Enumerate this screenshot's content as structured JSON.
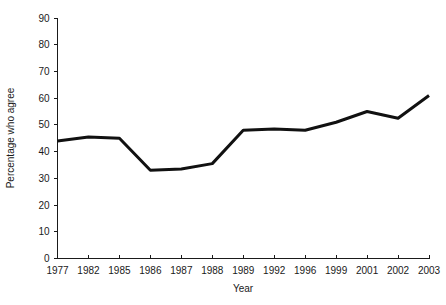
{
  "chart_data": {
    "type": "line",
    "title": "",
    "xlabel": "Year",
    "ylabel": "Percentage who agree",
    "categories": [
      "1977",
      "1982",
      "1985",
      "1986",
      "1987",
      "1988",
      "1989",
      "1992",
      "1996",
      "1999",
      "2001",
      "2002",
      "2003"
    ],
    "values": [
      44,
      45.5,
      45,
      33,
      33.5,
      35.5,
      48,
      48.5,
      48,
      51,
      55,
      52.5,
      61
    ],
    "series": [
      {
        "name": "Percentage who agree",
        "values": [
          44,
          45.5,
          45,
          33,
          33.5,
          35.5,
          48,
          48.5,
          48,
          51,
          55,
          52.5,
          61
        ],
        "color": "#111111"
      }
    ],
    "ylim": [
      0,
      90
    ],
    "yticks": [
      0,
      10,
      20,
      30,
      40,
      50,
      60,
      70,
      80,
      90
    ],
    "ytick_labels": [
      "0",
      "10",
      "20",
      "30",
      "40",
      "50",
      "60",
      "70",
      "80",
      "90"
    ],
    "grid": false,
    "legend": "none",
    "line_color": "#111111",
    "axis_color": "#1a1a1a",
    "background": "#ffffff"
  }
}
